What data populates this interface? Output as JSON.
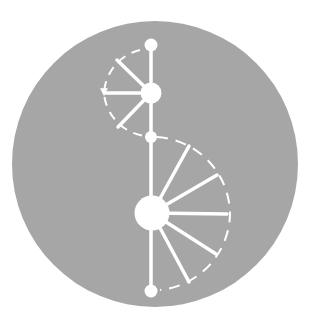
{
  "logo": {
    "name": "spiral-staircase-badge",
    "colors": {
      "background": "#ffffff",
      "circle": "#a6a6a6",
      "foreground": "#ffffff"
    }
  }
}
